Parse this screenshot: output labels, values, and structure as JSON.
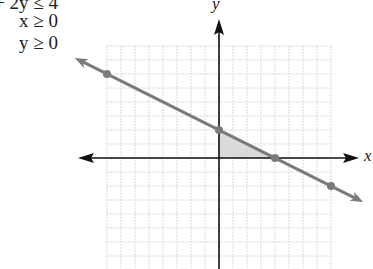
{
  "constraints": [
    "x + 2y ≤ 4",
    "x ≥ 0",
    "y ≥ 0"
  ],
  "axes": {
    "x_label": "x",
    "y_label": "y"
  },
  "colors": {
    "line": "#7a7a7a",
    "axis": "#111111",
    "grid": "#d9d9d9",
    "shade": "#d6d6d6"
  },
  "chart_data": {
    "type": "line",
    "title": "",
    "annotations": [
      "x + 2y ≤ 4",
      "x ≥ 0",
      "y ≥ 0"
    ],
    "xlabel": "x",
    "ylabel": "y",
    "xlim": [
      -8,
      8
    ],
    "ylim": [
      -8,
      8
    ],
    "grid": true,
    "grid_step": 1,
    "series": [
      {
        "name": "x + 2y = 4",
        "x": [
          -8,
          0,
          4,
          8
        ],
        "y": [
          6,
          2,
          0,
          -2
        ],
        "marked_points": [
          [
            -8,
            6
          ],
          [
            0,
            2
          ],
          [
            4,
            0
          ],
          [
            8,
            -2
          ]
        ]
      }
    ],
    "shaded_region": {
      "name": "feasible region",
      "vertices": [
        [
          0,
          0
        ],
        [
          0,
          2
        ],
        [
          4,
          0
        ]
      ]
    }
  }
}
